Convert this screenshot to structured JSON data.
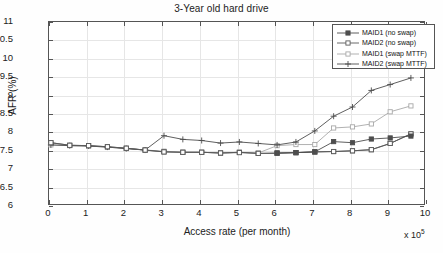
{
  "chart_data": {
    "type": "line",
    "title": "3-Year old hard drive",
    "xlabel": "Access rate (per month)",
    "ylabel": "AFR (%)",
    "x_multiplier": "x 10",
    "x_multiplier_exp": "5",
    "xlim": [
      0,
      10
    ],
    "ylim": [
      6,
      11
    ],
    "xticks": [
      "0",
      "1",
      "2",
      "3",
      "4",
      "5",
      "6",
      "7",
      "8",
      "9",
      "10"
    ],
    "yticks": [
      "6",
      "6.5",
      "7",
      "7.5",
      "8",
      "8.5",
      "9",
      "9.5",
      "10",
      "10.5",
      "11"
    ],
    "grid": true,
    "legend_position": "top-right",
    "x": [
      0.05,
      0.55,
      1.05,
      1.55,
      2.05,
      2.55,
      3.05,
      3.55,
      4.05,
      4.55,
      5.05,
      5.55,
      6.05,
      6.55,
      7.05,
      7.55,
      8.05,
      8.55,
      9.05,
      9.6
    ],
    "series": [
      {
        "name": "MAID1 (no swap)",
        "marker": "filled-square",
        "color": "#4d4d4d",
        "values": [
          7.72,
          7.65,
          7.64,
          7.61,
          7.57,
          7.52,
          7.47,
          7.46,
          7.46,
          7.44,
          7.46,
          7.43,
          7.44,
          7.45,
          7.47,
          7.48,
          7.5,
          7.53,
          7.7,
          7.96
        ]
      },
      {
        "name": "MAID2 (no swap)",
        "marker": "open-square",
        "color": "#5a5a5a",
        "values": [
          7.72,
          7.65,
          7.64,
          7.61,
          7.57,
          7.52,
          7.47,
          7.46,
          7.46,
          7.44,
          7.45,
          7.43,
          7.43,
          7.45,
          7.47,
          7.48,
          7.5,
          7.53,
          7.7,
          7.96
        ]
      },
      {
        "name": "MAID1 (swap MTTF)",
        "marker": "light-square",
        "color": "#a8a8a8",
        "values": [
          7.66,
          7.64,
          7.63,
          7.6,
          7.56,
          7.52,
          7.49,
          7.46,
          7.46,
          7.44,
          7.46,
          7.44,
          7.64,
          7.67,
          7.67,
          8.12,
          8.15,
          8.23,
          8.56,
          8.72
        ]
      },
      {
        "name": "MAID2 (swap MTTF)",
        "marker": "plus",
        "color": "#4d4d4d",
        "values": [
          7.66,
          7.64,
          7.63,
          7.6,
          7.56,
          7.52,
          7.91,
          7.81,
          7.78,
          7.71,
          7.74,
          7.7,
          7.66,
          7.74,
          8.04,
          8.44,
          8.69,
          9.14,
          9.3,
          9.48
        ]
      }
    ],
    "series_dark_overlay": {
      "name": "MAID1 (no swap) upper branch",
      "marker": "filled-square",
      "color": "#4d4d4d",
      "x": [
        6.05,
        6.55,
        7.05,
        7.55,
        8.05,
        8.55,
        9.05,
        9.6
      ],
      "values": [
        7.44,
        7.45,
        7.47,
        7.75,
        7.72,
        7.82,
        7.85,
        7.9
      ]
    }
  }
}
